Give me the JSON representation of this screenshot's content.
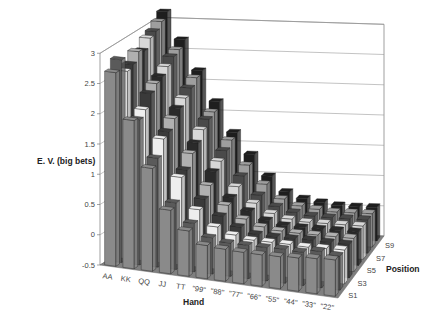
{
  "chart_data": {
    "type": "bar3d",
    "title": "",
    "zlabel": "E. V. (big bets)",
    "xlabel": "Hand",
    "ylabel": "Position",
    "zlim": [
      -0.5,
      3
    ],
    "z_ticks": [
      "-0.5",
      "0",
      "0.5",
      "1",
      "1.5",
      "2",
      "2.5",
      "3"
    ],
    "categories": [
      "AA",
      "KK",
      "QQ",
      "JJ",
      "TT",
      "\"99\"",
      "\"88\"",
      "\"77\"",
      "\"66\"",
      "\"55\"",
      "\"44\"",
      "\"33\"",
      "\"22\""
    ],
    "positions": [
      "S1",
      "S2",
      "S3",
      "S4",
      "S5",
      "S6",
      "S7",
      "S8",
      "S9",
      "S10"
    ],
    "position_tick_labels": [
      "S1",
      "S3",
      "S5",
      "S7",
      "S9"
    ],
    "grid": true,
    "series": [
      {
        "name": "S1",
        "values": [
          2.7,
          1.95,
          1.2,
          0.55,
          0.25,
          0.05,
          0.03,
          0.02,
          0.02,
          0.03,
          0.05,
          0.08,
          0.1
        ]
      },
      {
        "name": "S2",
        "values": [
          2.85,
          1.9,
          1.3,
          0.6,
          0.3,
          0.1,
          0.05,
          0.05,
          0.05,
          0.06,
          0.05,
          0.1,
          0.06
        ]
      },
      {
        "name": "S3",
        "values": [
          2.6,
          2.0,
          1.55,
          0.95,
          0.45,
          0.2,
          0.1,
          0.05,
          0.05,
          0.05,
          0.04,
          0.05,
          0.06
        ]
      },
      {
        "name": "S4",
        "values": [
          2.65,
          2.2,
          1.6,
          1.0,
          0.55,
          0.3,
          0.15,
          0.06,
          0.05,
          0.05,
          0.06,
          0.05,
          0.05
        ]
      },
      {
        "name": "S5",
        "values": [
          2.8,
          2.3,
          1.75,
          1.2,
          0.7,
          0.4,
          0.2,
          0.1,
          0.06,
          0.05,
          0.05,
          0.05,
          0.05
        ]
      },
      {
        "name": "S6",
        "values": [
          2.75,
          2.35,
          1.85,
          1.3,
          0.85,
          0.45,
          0.25,
          0.12,
          0.06,
          0.05,
          0.05,
          0.05,
          0.05
        ]
      },
      {
        "name": "S7",
        "values": [
          2.9,
          2.45,
          1.95,
          1.45,
          0.95,
          0.55,
          0.3,
          0.15,
          0.08,
          0.05,
          0.05,
          0.05,
          0.05
        ]
      },
      {
        "name": "S8",
        "values": [
          2.95,
          2.55,
          2.05,
          1.55,
          1.05,
          0.65,
          0.35,
          0.18,
          0.1,
          0.06,
          0.05,
          0.05,
          0.05
        ]
      },
      {
        "name": "S9",
        "values": [
          3.05,
          2.6,
          2.15,
          1.6,
          1.15,
          0.75,
          0.45,
          0.22,
          0.12,
          0.08,
          0.05,
          0.05,
          0.05
        ]
      },
      {
        "name": "S10",
        "values": [
          3.15,
          2.7,
          2.2,
          1.7,
          1.2,
          0.85,
          0.5,
          0.25,
          0.15,
          0.1,
          0.06,
          0.05,
          0.05
        ]
      }
    ],
    "legend": null
  },
  "colors": {
    "floor": "#7f7f7f",
    "gridline": "#9a9a9a",
    "frame": "#777777",
    "bar_palette": [
      "#8a8a8a",
      "#5a5a5a",
      "#eeeeee",
      "#3a3a3a",
      "#b0b0b0",
      "#2a2a2a",
      "#d8d8d8",
      "#4a4a4a",
      "#9e9e9e",
      "#1e1e1e"
    ]
  }
}
